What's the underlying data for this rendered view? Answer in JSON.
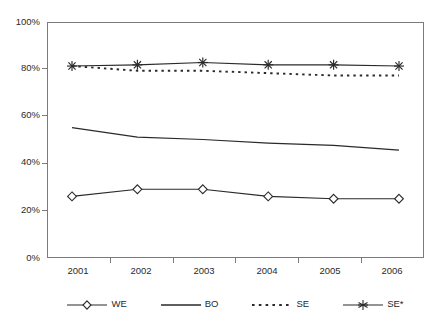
{
  "chart_data": {
    "type": "line",
    "title": "",
    "subtitle": "",
    "xlabel": "",
    "ylabel": "",
    "categories": [
      "2001",
      "2002",
      "2003",
      "2004",
      "2005",
      "2006"
    ],
    "ylim": [
      0,
      100
    ],
    "yticks": [
      0,
      20,
      40,
      60,
      80,
      100
    ],
    "ytick_labels": [
      "0%",
      "20%",
      "40%",
      "60%",
      "80%",
      "100%"
    ],
    "grid": false,
    "legend_position": "bottom",
    "series": [
      {
        "name": "WE",
        "marker": "diamond-open",
        "line_style": "solid",
        "color": "#2a2a2a",
        "values": [
          26,
          29,
          29,
          26,
          25,
          25
        ]
      },
      {
        "name": "BO",
        "marker": "none",
        "line_style": "solid",
        "color": "#2a2a2a",
        "values": [
          55,
          51,
          50,
          48.5,
          47.5,
          45.5
        ]
      },
      {
        "name": "SE",
        "marker": "none",
        "line_style": "dotted",
        "color": "#2a2a2a",
        "values": [
          81,
          79,
          79,
          78,
          77,
          77
        ]
      },
      {
        "name": "SE*",
        "marker": "asterisk",
        "line_style": "solid",
        "color": "#2a2a2a",
        "values": [
          81,
          81.5,
          82.5,
          81.5,
          81.5,
          81
        ]
      }
    ]
  },
  "axes": {
    "y_labels": [
      "100%",
      "80%",
      "60%",
      "40%",
      "20%",
      "0%"
    ],
    "x_labels": [
      "2001",
      "2002",
      "2003",
      "2004",
      "2005",
      "2006"
    ]
  },
  "legend": {
    "items": [
      {
        "label": "WE",
        "marker": "diamond-open",
        "style": "solid"
      },
      {
        "label": "BO",
        "marker": "none",
        "style": "solid"
      },
      {
        "label": "SE",
        "marker": "none",
        "style": "dotted"
      },
      {
        "label": "SE*",
        "marker": "asterisk",
        "style": "solid"
      }
    ]
  },
  "colors": {
    "ink": "#2a2a2a",
    "frame": "#7b7b7b",
    "background": "#ffffff"
  }
}
